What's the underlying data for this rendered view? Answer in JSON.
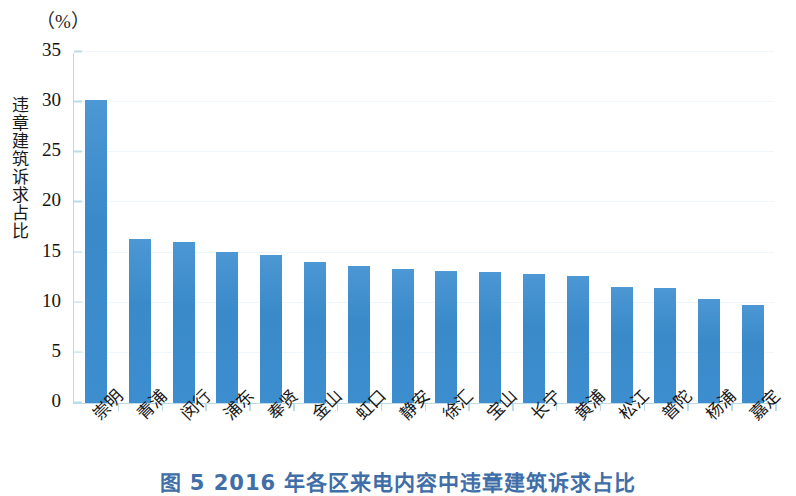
{
  "figure": {
    "unit_label": "（%）",
    "y_axis_title": "违章建筑诉求占比",
    "caption": "图 5   2016 年各区来电内容中违章建筑诉求占比",
    "bar_color": "#3d8dcc",
    "axis_color": "#bcdbe9",
    "caption_color": "#3f6ea8"
  },
  "chart_data": {
    "type": "bar",
    "title": "图 5   2016 年各区来电内容中违章建筑诉求占比",
    "xlabel": "",
    "ylabel": "违章建筑诉求占比",
    "unit": "%",
    "ylim": [
      0,
      35
    ],
    "yticks": [
      0,
      5,
      10,
      15,
      20,
      25,
      30,
      35
    ],
    "ytick_labels": [
      "0",
      "5",
      "10",
      "15",
      "20",
      "25",
      "30",
      "35"
    ],
    "grid": true,
    "legend": false,
    "categories": [
      "崇明",
      "青浦",
      "闵行",
      "浦东",
      "奉贤",
      "金山",
      "虹口",
      "静安",
      "徐汇",
      "宝山",
      "长宁",
      "黄浦",
      "松江",
      "普陀",
      "杨浦",
      "嘉定"
    ],
    "values": [
      30.2,
      16.4,
      16.1,
      15.1,
      14.8,
      14.1,
      13.7,
      13.4,
      13.2,
      13.1,
      12.9,
      12.7,
      11.6,
      11.5,
      10.4,
      9.8
    ]
  }
}
